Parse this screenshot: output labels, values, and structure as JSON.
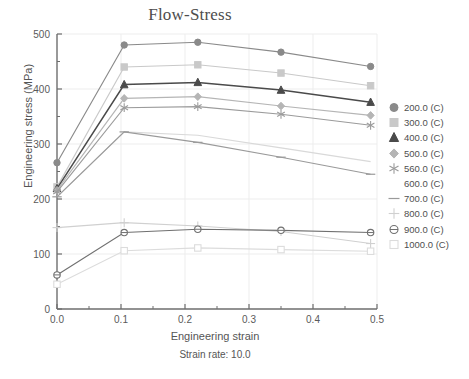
{
  "chart_data": {
    "type": "line",
    "title": "Flow-Stress",
    "subtitle": "Strain rate: 10.0",
    "xlabel": "Engineering strain",
    "ylabel": "Engineering stress (MPa)",
    "xlim": [
      0.0,
      0.5
    ],
    "ylim": [
      0,
      500
    ],
    "xticks": [
      0.0,
      0.1,
      0.2,
      0.3,
      0.4,
      0.5
    ],
    "xticklabels": [
      "0.0",
      "0.1",
      "0.2",
      "0.3",
      "0.4",
      "0.5"
    ],
    "xminor_step": 0.05,
    "yticks": [
      0,
      100,
      200,
      300,
      400,
      500
    ],
    "yticklabels": [
      "0",
      "100",
      "200",
      "300",
      "400",
      "500"
    ],
    "yminor_step": 50,
    "grid": true,
    "legend_position": "right",
    "x": [
      0.0,
      0.105,
      0.22,
      0.35,
      0.49
    ],
    "series": [
      {
        "name": "200.0 (C)",
        "marker": "circle-filled",
        "color": "#8a8a8a",
        "values": [
          266,
          480,
          485,
          467,
          441
        ]
      },
      {
        "name": "300.0 (C)",
        "marker": "square-filled",
        "color": "#c9c9c9",
        "values": [
          222,
          440,
          444,
          429,
          406
        ]
      },
      {
        "name": "400.0 (C)",
        "marker": "triangle-filled",
        "color": "#4a4a4a",
        "values": [
          219,
          408,
          412,
          398,
          376
        ]
      },
      {
        "name": "500.0 (C)",
        "marker": "diamond-filled",
        "color": "#b5b5b5",
        "values": [
          216,
          383,
          386,
          369,
          352
        ]
      },
      {
        "name": "560.0 (C)",
        "marker": "asterisk",
        "color": "#9b9b9b",
        "values": [
          213,
          366,
          368,
          354,
          334
        ]
      },
      {
        "name": "600.0 (C)",
        "marker": "none",
        "color": "#d9d9d9",
        "values": [
          204,
          322,
          316,
          293,
          268
        ]
      },
      {
        "name": "700.0 (C)",
        "marker": "dash",
        "color": "#9a9a9a",
        "values": [
          204,
          322,
          303,
          276,
          245
        ]
      },
      {
        "name": "800.0 (C)",
        "marker": "plus",
        "color": "#d0d0d0",
        "values": [
          148,
          157,
          151,
          141,
          119
        ]
      },
      {
        "name": "900.0 (C)",
        "marker": "circle-open",
        "color": "#707070",
        "values": [
          62,
          139,
          145,
          143,
          139
        ]
      },
      {
        "name": "1000.0 (C)",
        "marker": "square-open",
        "color": "#dcdcdc",
        "values": [
          45,
          106,
          111,
          108,
          105
        ]
      }
    ]
  },
  "legend": {
    "entries": [
      {
        "label": "200.0 (C)"
      },
      {
        "label": "300.0 (C)"
      },
      {
        "label": "400.0 (C)"
      },
      {
        "label": "500.0 (C)"
      },
      {
        "label": "560.0 (C)"
      },
      {
        "label": "600.0 (C)"
      },
      {
        "label": "700.0 (C)"
      },
      {
        "label": "800.0 (C)"
      },
      {
        "label": "900.0 (C)"
      },
      {
        "label": "1000.0 (C)"
      }
    ]
  },
  "colors": {
    "axis": "#6e6e6e",
    "grid": "#ededed",
    "text": "#4f4f4f",
    "background": "#ffffff"
  }
}
